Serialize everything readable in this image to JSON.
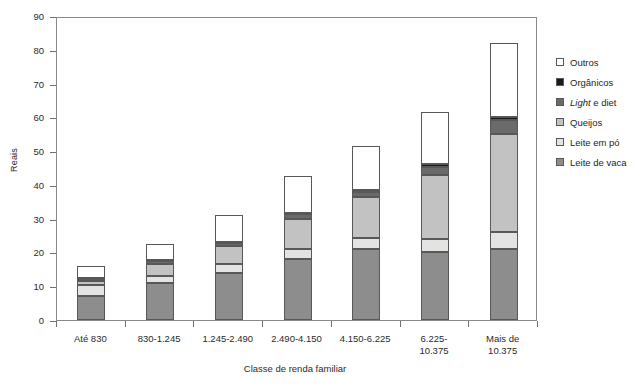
{
  "chart_data": {
    "type": "bar",
    "subtype": "stacked-bar",
    "title": "",
    "xlabel": "Classe de renda familiar",
    "ylabel": "Reais",
    "ylim": [
      0,
      90
    ],
    "yticks": [
      0,
      10,
      20,
      30,
      40,
      50,
      60,
      70,
      80,
      90
    ],
    "ytick_step": 10,
    "grid": false,
    "legend_position": "right",
    "categories": [
      "Até 830",
      "830-1.245",
      "1.245-2.490",
      "2.490-4.150",
      "4.150-6.225",
      "6.225-\n10.375",
      "Mais de\n10.375"
    ],
    "series": [
      {
        "name": "Leite de vaca",
        "color": "#8d8d8d",
        "values": [
          7.0,
          11.0,
          14.0,
          18.0,
          21.0,
          20.0,
          21.0
        ]
      },
      {
        "name": "Leite em pó",
        "color": "#e3e3e1",
        "values": [
          3.4,
          2.0,
          2.5,
          3.0,
          3.2,
          4.0,
          5.0
        ]
      },
      {
        "name": "Queijos",
        "color": "#c2c2c2",
        "values": [
          1.2,
          3.7,
          5.5,
          9.0,
          12.3,
          19.0,
          29.0
        ]
      },
      {
        "name": "Light e diet",
        "color": "#6a6a6a",
        "values": [
          0.5,
          0.7,
          0.8,
          1.3,
          1.4,
          2.4,
          4.2
        ]
      },
      {
        "name": "Orgânicos",
        "color": "#1a1a1a",
        "values": [
          0.4,
          0.3,
          0.3,
          0.4,
          0.5,
          0.9,
          1.0
        ]
      },
      {
        "name": "Outros",
        "color": "#ffffff",
        "values": [
          3.5,
          4.8,
          7.9,
          10.8,
          13.1,
          15.2,
          21.8
        ]
      }
    ],
    "totals": [
      16.0,
      22.5,
      31.0,
      42.5,
      51.5,
      61.5,
      82.0
    ]
  },
  "legend": {
    "items": [
      {
        "label": "Outros",
        "icon": "legend-swatch-outros",
        "color": "#ffffff",
        "italic_prefix": ""
      },
      {
        "label": "Orgânicos",
        "icon": "legend-swatch-organicos",
        "color": "#1a1a1a",
        "italic_prefix": ""
      },
      {
        "label": "e diet",
        "icon": "legend-swatch-light-e-diet",
        "color": "#6a6a6a",
        "italic_prefix": "Light"
      },
      {
        "label": "Queijos",
        "icon": "legend-swatch-queijos",
        "color": "#c2c2c2",
        "italic_prefix": ""
      },
      {
        "label": "Leite em pó",
        "icon": "legend-swatch-leite-em-po",
        "color": "#e3e3e1",
        "italic_prefix": ""
      },
      {
        "label": "Leite de vaca",
        "icon": "legend-swatch-leite-de-vaca",
        "color": "#8d8d8d",
        "italic_prefix": ""
      }
    ]
  },
  "axes": {
    "y_title": "Reais",
    "x_title": "Classe de renda familiar"
  }
}
